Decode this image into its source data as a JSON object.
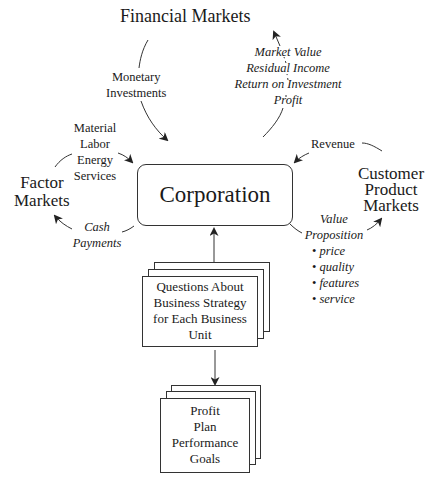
{
  "nodes": {
    "financial_markets": "Financial Markets",
    "factor_markets": [
      "Factor",
      "Markets"
    ],
    "customer_markets": [
      "Customer",
      "Product",
      "Markets"
    ],
    "corporation": "Corporation",
    "strategy_questions": [
      "Questions About",
      "Business Strategy",
      "for Each Business",
      "Unit"
    ],
    "profit_plan": [
      "Profit",
      "Plan",
      "Performance",
      "Goals"
    ]
  },
  "flows": {
    "monetary_investments": [
      "Monetary",
      "Investments"
    ],
    "financial_returns": [
      "Market Value",
      "Residual Income",
      "Return on Investment",
      "Profit"
    ],
    "factor_inputs": [
      "Material",
      "Labor",
      "Energy",
      "Services"
    ],
    "cash_payments": [
      "Cash",
      "Payments"
    ],
    "revenue": "Revenue",
    "value_proposition": {
      "title": [
        "Value",
        "Proposition"
      ],
      "items": [
        "price",
        "quality",
        "features",
        "service"
      ]
    }
  },
  "colors": {
    "line": "#333333",
    "text": "#1a1a1a",
    "background": "#ffffff"
  }
}
